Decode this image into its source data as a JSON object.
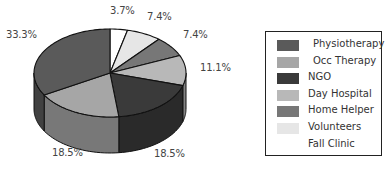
{
  "chart_data": {
    "type": "pie",
    "style": "3d",
    "title": "",
    "start_angle": "12 o'clock, clockwise",
    "categories": [
      "Physiotherapy",
      "Occ Therapy",
      "NGO",
      "Day Hospital",
      "Home Helper",
      "Volunteers",
      "Fall Clinic"
    ],
    "values": [
      33.3,
      18.5,
      18.5,
      11.1,
      7.4,
      7.4,
      3.7
    ],
    "unit": "%",
    "colors": {
      "Physiotherapy": "#5a5a5a",
      "Occ Therapy": "#a6a6a6",
      "NGO": "#3a3a3a",
      "Day Hospital": "#b8b8b8",
      "Home Helper": "#777777",
      "Volunteers": "#e6e6e6",
      "Fall Clinic": "#ffffff"
    },
    "clockwise_order_from_top": [
      "Fall Clinic",
      "Volunteers",
      "Home Helper",
      "Day Hospital",
      "NGO",
      "Occ Therapy",
      "Physiotherapy"
    ],
    "legend_position": "right"
  },
  "labels": {
    "fall_clinic": "3.7%",
    "volunteers": "7.4%",
    "home_helper": "7.4%",
    "day_hospital": "11.1%",
    "ngo": "18.5%",
    "occ_therapy": "18.5%",
    "physiotherapy": "33.3%"
  },
  "legend": {
    "items": [
      {
        "label": "Physiotherapy",
        "color": "#5a5a5a"
      },
      {
        "label": "Occ Therapy",
        "color": "#a6a6a6"
      },
      {
        "label": "NGO",
        "color": "#3a3a3a"
      },
      {
        "label": "Day Hospital",
        "color": "#b8b8b8"
      },
      {
        "label": "Home Helper",
        "color": "#777777"
      },
      {
        "label": "Volunteers",
        "color": "#e6e6e6"
      },
      {
        "label": "Fall Clinic",
        "color": "#ffffff"
      }
    ]
  }
}
